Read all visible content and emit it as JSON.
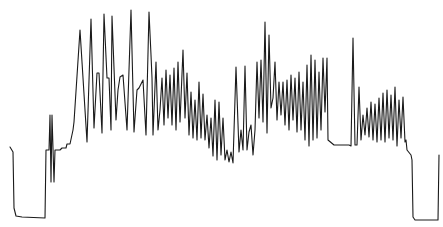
{
  "chart_data": {
    "type": "line",
    "title": "",
    "xlabel": "",
    "ylabel": "",
    "grid": false,
    "legend": null,
    "axes_visible": false,
    "stroke_color": "#1a1a1a",
    "background_color": "#ffffff",
    "coordinate_space": "pixel (x right, y down), 443x227",
    "series": [
      {
        "name": "trace",
        "points": [
          [
            10,
            147
          ],
          [
            13,
            152
          ],
          [
            14,
            208
          ],
          [
            16,
            216
          ],
          [
            22,
            217
          ],
          [
            45,
            218
          ],
          [
            46,
            150
          ],
          [
            49,
            150
          ],
          [
            50,
            115
          ],
          [
            51,
            182
          ],
          [
            52,
            115
          ],
          [
            54,
            182
          ],
          [
            55,
            150
          ],
          [
            60,
            150
          ],
          [
            62,
            148
          ],
          [
            66,
            148
          ],
          [
            67,
            144
          ],
          [
            70,
            144
          ],
          [
            73,
            130
          ],
          [
            74,
            122
          ],
          [
            80,
            30
          ],
          [
            87,
            142
          ],
          [
            91,
            19
          ],
          [
            94,
            128
          ],
          [
            97,
            73
          ],
          [
            99,
            73
          ],
          [
            102,
            133
          ],
          [
            104,
            14
          ],
          [
            107,
            78
          ],
          [
            109,
            78
          ],
          [
            111,
            130
          ],
          [
            112,
            16
          ],
          [
            116,
            120
          ],
          [
            118,
            90
          ],
          [
            120,
            77
          ],
          [
            123,
            75
          ],
          [
            127,
            130
          ],
          [
            131,
            10
          ],
          [
            134,
            132
          ],
          [
            137,
            90
          ],
          [
            139,
            88
          ],
          [
            143,
            80
          ],
          [
            146,
            135
          ],
          [
            149,
            12
          ],
          [
            151,
            55
          ],
          [
            152,
            78
          ],
          [
            153,
            135
          ],
          [
            156,
            62
          ],
          [
            158,
            130
          ],
          [
            160,
            110
          ],
          [
            162,
            78
          ],
          [
            164,
            125
          ],
          [
            166,
            70
          ],
          [
            168,
            118
          ],
          [
            170,
            75
          ],
          [
            172,
            125
          ],
          [
            174,
            68
          ],
          [
            176,
            130
          ],
          [
            178,
            62
          ],
          [
            180,
            122
          ],
          [
            183,
            50
          ],
          [
            185,
            118
          ],
          [
            187,
            73
          ],
          [
            189,
            135
          ],
          [
            191,
            92
          ],
          [
            193,
            138
          ],
          [
            195,
            100
          ],
          [
            197,
            140
          ],
          [
            199,
            82
          ],
          [
            201,
            138
          ],
          [
            203,
            94
          ],
          [
            205,
            140
          ],
          [
            207,
            115
          ],
          [
            209,
            148
          ],
          [
            211,
            118
          ],
          [
            213,
            156
          ],
          [
            215,
            100
          ],
          [
            217,
            160
          ],
          [
            219,
            102
          ],
          [
            221,
            155
          ],
          [
            223,
            118
          ],
          [
            225,
            160
          ],
          [
            227,
            150
          ],
          [
            229,
            162
          ],
          [
            231,
            152
          ],
          [
            233,
            163
          ],
          [
            236,
            67
          ],
          [
            239,
            152
          ],
          [
            241,
            130
          ],
          [
            243,
            150
          ],
          [
            245,
            66
          ],
          [
            247,
            150
          ],
          [
            249,
            132
          ],
          [
            251,
            125
          ],
          [
            253,
            155
          ],
          [
            255,
            130
          ],
          [
            257,
            62
          ],
          [
            259,
            118
          ],
          [
            261,
            60
          ],
          [
            263,
            122
          ],
          [
            265,
            22
          ],
          [
            267,
            133
          ],
          [
            269,
            35
          ],
          [
            271,
            108
          ],
          [
            273,
            98
          ],
          [
            275,
            62
          ],
          [
            277,
            120
          ],
          [
            279,
            82
          ],
          [
            281,
            115
          ],
          [
            283,
            82
          ],
          [
            285,
            125
          ],
          [
            287,
            80
          ],
          [
            289,
            130
          ],
          [
            291,
            75
          ],
          [
            293,
            120
          ],
          [
            295,
            78
          ],
          [
            297,
            132
          ],
          [
            299,
            72
          ],
          [
            301,
            130
          ],
          [
            303,
            82
          ],
          [
            305,
            140
          ],
          [
            307,
            65
          ],
          [
            309,
            146
          ],
          [
            311,
            55
          ],
          [
            313,
            140
          ],
          [
            315,
            60
          ],
          [
            317,
            138
          ],
          [
            319,
            72
          ],
          [
            321,
            130
          ],
          [
            323,
            58
          ],
          [
            325,
            112
          ],
          [
            327,
            58
          ],
          [
            328,
            140
          ],
          [
            334,
            145
          ],
          [
            345,
            145
          ],
          [
            349,
            145
          ],
          [
            351,
            146
          ],
          [
            353,
            38
          ],
          [
            355,
            145
          ],
          [
            357,
            145
          ],
          [
            359,
            87
          ],
          [
            361,
            140
          ],
          [
            363,
            115
          ],
          [
            365,
            135
          ],
          [
            367,
            108
          ],
          [
            369,
            137
          ],
          [
            371,
            102
          ],
          [
            373,
            140
          ],
          [
            375,
            104
          ],
          [
            377,
            142
          ],
          [
            379,
            98
          ],
          [
            381,
            140
          ],
          [
            383,
            93
          ],
          [
            385,
            142
          ],
          [
            387,
            90
          ],
          [
            389,
            138
          ],
          [
            391,
            95
          ],
          [
            393,
            140
          ],
          [
            395,
            87
          ],
          [
            397,
            146
          ],
          [
            399,
            100
          ],
          [
            401,
            138
          ],
          [
            403,
            97
          ],
          [
            405,
            142
          ],
          [
            406,
            140
          ],
          [
            407,
            150
          ],
          [
            411,
            155
          ],
          [
            412,
            160
          ],
          [
            413,
            217
          ],
          [
            415,
            220
          ],
          [
            430,
            220
          ],
          [
            438,
            220
          ],
          [
            439,
            155
          ]
        ]
      }
    ],
    "xlim": [
      0,
      443
    ],
    "ylim": [
      227,
      0
    ]
  }
}
